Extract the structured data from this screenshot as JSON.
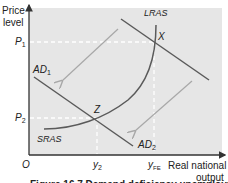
{
  "diagram": {
    "type": "economics-ad-as",
    "y_axis_label_line1": "Price",
    "y_axis_label_line2": "level",
    "x_axis_label_line1": "Real national",
    "x_axis_label_line2": "output",
    "origin_label": "O",
    "price_levels": {
      "p1": {
        "base": "P",
        "sub": "1"
      },
      "p2": {
        "base": "P",
        "sub": "2"
      }
    },
    "output_levels": {
      "y2": {
        "base": "y",
        "sub": "2"
      },
      "yfe": {
        "base": "y",
        "sub": "FE"
      }
    },
    "curves": {
      "lras": "LRAS",
      "sras": "SRAS",
      "ad1": {
        "base": "AD",
        "sub": "1"
      },
      "ad2": {
        "base": "AD",
        "sub": "2"
      }
    },
    "points": {
      "x": "X",
      "z": "Z"
    },
    "caption": "Figure 16.7 Demand deficiency unemployment",
    "colors": {
      "plot_bg": "#e6e6e6",
      "curve": "#5a5a5a",
      "arrow": "#a8a8a8",
      "axis": "#333333",
      "guide": "#ffffff"
    }
  }
}
